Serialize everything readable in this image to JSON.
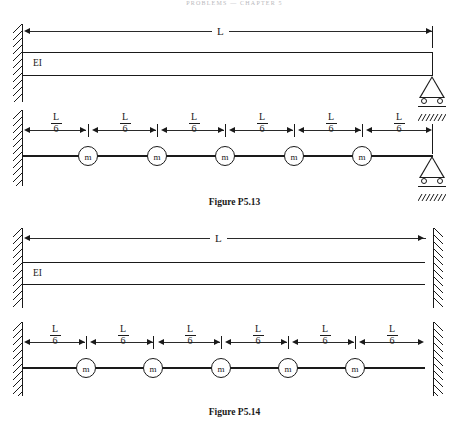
{
  "page": {
    "running_head": "PROBLEMS — CHAPTER 5",
    "ink_color": "#1a1a1a",
    "background_color": "#ffffff"
  },
  "figures": [
    {
      "id": "P5.13",
      "caption": "Figure P5.13",
      "beam_diagram": {
        "span_label": "L",
        "stiffness_label": "EI",
        "left_support": "fixed-wall",
        "right_support": "roller"
      },
      "mass_model": {
        "segment_labels": [
          {
            "numerator": "L",
            "denominator": "6"
          },
          {
            "numerator": "L",
            "denominator": "6"
          },
          {
            "numerator": "L",
            "denominator": "6"
          },
          {
            "numerator": "L",
            "denominator": "6"
          },
          {
            "numerator": "L",
            "denominator": "6"
          },
          {
            "numerator": "L",
            "denominator": "6"
          }
        ],
        "masses": [
          "m",
          "m",
          "m",
          "m",
          "m"
        ],
        "left_support": "fixed-wall",
        "right_support": "roller"
      }
    },
    {
      "id": "P5.14",
      "caption": "Figure P5.14",
      "beam_diagram": {
        "span_label": "L",
        "stiffness_label": "EI",
        "left_support": "fixed-wall",
        "right_support": "fixed-wall"
      },
      "mass_model": {
        "segment_labels": [
          {
            "numerator": "L",
            "denominator": "6"
          },
          {
            "numerator": "L",
            "denominator": "6"
          },
          {
            "numerator": "L",
            "denominator": "6"
          },
          {
            "numerator": "L",
            "denominator": "6"
          },
          {
            "numerator": "L",
            "denominator": "6"
          },
          {
            "numerator": "L",
            "denominator": "6"
          }
        ],
        "masses": [
          "m",
          "m",
          "m",
          "m",
          "m"
        ],
        "left_support": "fixed-wall",
        "right_support": "fixed-wall"
      }
    }
  ]
}
